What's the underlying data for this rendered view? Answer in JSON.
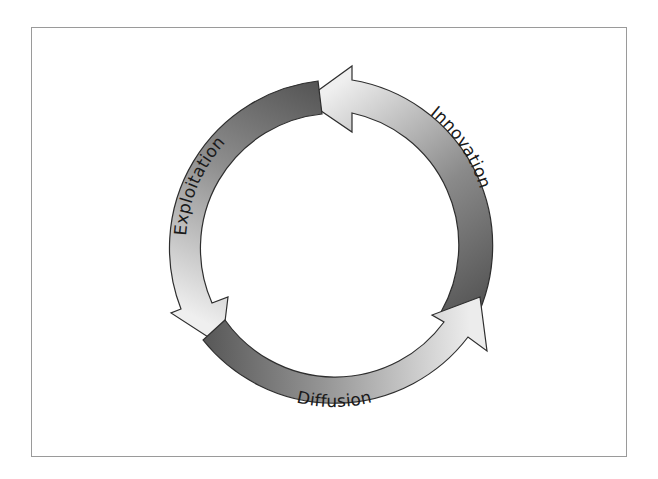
{
  "diagram": {
    "type": "cycle",
    "direction": "counter-clockwise",
    "stages": [
      {
        "id": "innovation",
        "label": "Innovation"
      },
      {
        "id": "exploitation",
        "label": "Exploitation"
      },
      {
        "id": "diffusion",
        "label": "Diffusion"
      }
    ],
    "colors": {
      "dark": "#5a5a5a",
      "mid": "#8c8c8c",
      "light": "#e8e8e8",
      "stroke": "#2e2e2e",
      "frame": "#9a9a9a",
      "text": "#1a1a1a"
    }
  }
}
